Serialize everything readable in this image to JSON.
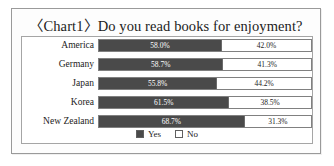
{
  "figure": {
    "title": "〈Chart1〉Do you read books for enjoyment?"
  },
  "legend": {
    "items": [
      {
        "label": "Yes",
        "swatch": "filled-dark-square-swatch",
        "color": "#4a4a4a"
      },
      {
        "label": "No",
        "swatch": "outlined-white-square-swatch",
        "color": "#ffffff"
      }
    ]
  },
  "chart_data": {
    "type": "bar",
    "orientation": "horizontal",
    "stacked": true,
    "title": "〈Chart1〉Do you read books for enjoyment?",
    "xlabel": "",
    "ylabel": "",
    "xlim": [
      0,
      100
    ],
    "grid": false,
    "legend_position": "bottom-center",
    "value_unit": "%",
    "categories": [
      "America",
      "Germany",
      "Japan",
      "Korea",
      "New Zealand"
    ],
    "series": [
      {
        "name": "Yes",
        "color": "#4a4a4a",
        "values": [
          58.0,
          58.7,
          55.8,
          61.5,
          68.7
        ],
        "labels": [
          "58.0%",
          "58.7%",
          "55.8%",
          "61.5%",
          "68.7%"
        ]
      },
      {
        "name": "No",
        "color": "#ffffff",
        "values": [
          42.0,
          41.3,
          44.2,
          38.5,
          31.3
        ],
        "labels": [
          "42.0%",
          "41.3%",
          "44.2%",
          "38.5%",
          "31.3%"
        ]
      }
    ],
    "rows": [
      {
        "category": "America",
        "yes": 58.0,
        "no": 42.0,
        "yes_label": "58.0%",
        "no_label": "42.0%"
      },
      {
        "category": "Germany",
        "yes": 58.7,
        "no": 41.3,
        "yes_label": "58.7%",
        "no_label": "41.3%"
      },
      {
        "category": "Japan",
        "yes": 55.8,
        "no": 44.2,
        "yes_label": "55.8%",
        "no_label": "44.2%"
      },
      {
        "category": "Korea",
        "yes": 61.5,
        "no": 38.5,
        "yes_label": "61.5%",
        "no_label": "38.5%"
      },
      {
        "category": "New Zealand",
        "yes": 68.7,
        "no": 31.3,
        "yes_label": "68.7%",
        "no_label": "31.3%"
      }
    ]
  }
}
